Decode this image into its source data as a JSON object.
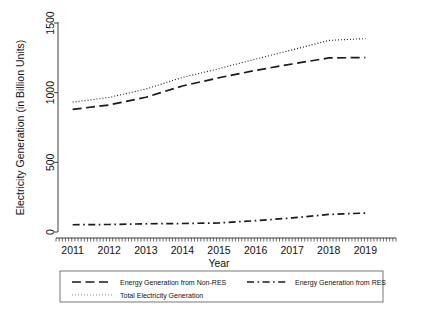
{
  "chart_data": {
    "type": "line",
    "title": "",
    "xlabel": "Year",
    "ylabel": "Electricity Generation (in Billion Units)",
    "x": [
      2011,
      2012,
      2013,
      2014,
      2015,
      2016,
      2017,
      2018,
      2019
    ],
    "xtick_labels": [
      "2011",
      "2012",
      "2013",
      "2014",
      "2015",
      "2016",
      "2017",
      "2018",
      "2019"
    ],
    "ytick_labels": [
      "0",
      "500",
      "1000",
      "1500"
    ],
    "ytick_values": [
      0,
      500,
      1000,
      1500
    ],
    "xlim": [
      2010.6,
      2019.4
    ],
    "ylim": [
      0,
      1500
    ],
    "grid": false,
    "legend_position": "bottom",
    "series": [
      {
        "name": "Energy Generation from Non-RES",
        "dash": "long-dash",
        "color": "#1a1a1a",
        "values": [
          880,
          912,
          967,
          1048,
          1107,
          1160,
          1206,
          1249,
          1252
        ]
      },
      {
        "name": "Energy Generation from RES",
        "dash": "dash-dot",
        "color": "#1a1a1a",
        "values": [
          52,
          54,
          59,
          61,
          65,
          81,
          101,
          126,
          136
        ]
      },
      {
        "name": "Total Electricity Generation",
        "dash": "dotted",
        "color": "#8c8c8c",
        "values": [
          932,
          966,
          1026,
          1109,
          1172,
          1241,
          1307,
          1375,
          1388
        ]
      }
    ]
  },
  "legend": {
    "items": [
      {
        "label": "Energy Generation from Non-RES",
        "swatch": "long-dash",
        "color": "#1a1a1a"
      },
      {
        "label": "Energy Generation from RES",
        "swatch": "dash-dot",
        "color": "#1a1a1a"
      },
      {
        "label": "Total Electricity Generation",
        "swatch": "dotted",
        "color": "#8c8c8c"
      }
    ]
  }
}
